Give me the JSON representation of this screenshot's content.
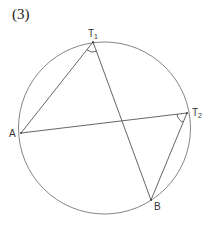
{
  "figure": {
    "label": "(3)"
  },
  "diagram": {
    "circle": {
      "cx": 104.5,
      "cy": 128,
      "r": 86,
      "stroke": "#777777"
    },
    "points": {
      "T1": {
        "label": "T",
        "sub": "1",
        "x": 93,
        "y": 42
      },
      "T2": {
        "label": "T",
        "sub": "2",
        "x": 187,
        "y": 113
      },
      "A": {
        "label": "A",
        "x": 21,
        "y": 133
      },
      "B": {
        "label": "B",
        "x": 151,
        "y": 200
      }
    },
    "segments": [
      {
        "from": "T1",
        "to": "A"
      },
      {
        "from": "T1",
        "to": "B"
      },
      {
        "from": "A",
        "to": "T2"
      },
      {
        "from": "T2",
        "to": "B"
      }
    ],
    "angle_marks": [
      {
        "at": "T1",
        "between": [
          "A",
          "B"
        ]
      },
      {
        "at": "T2",
        "between": [
          "A",
          "B"
        ]
      }
    ],
    "line_color": "#555555"
  }
}
